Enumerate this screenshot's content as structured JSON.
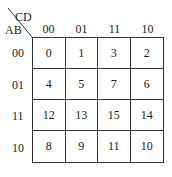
{
  "corner": {
    "col_var": "CD",
    "row_var": "AB"
  },
  "columns": [
    "00",
    "01",
    "11",
    "10"
  ],
  "rows": [
    {
      "label": "00",
      "cells": [
        "0",
        "1",
        "3",
        "2"
      ]
    },
    {
      "label": "01",
      "cells": [
        "4",
        "5",
        "7",
        "6"
      ]
    },
    {
      "label": "11",
      "cells": [
        "12",
        "13",
        "15",
        "14"
      ]
    },
    {
      "label": "10",
      "cells": [
        "8",
        "9",
        "11",
        "10"
      ]
    }
  ]
}
